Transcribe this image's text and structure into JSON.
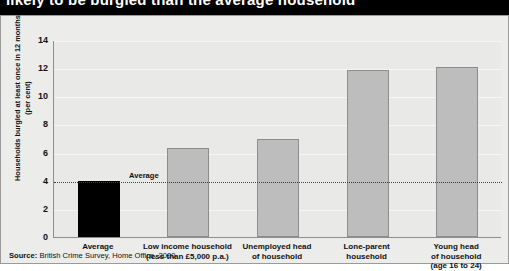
{
  "title": "likely to be burgled than the average household",
  "source_prefix": "Source:",
  "source_text": " British Crime Survey, Home Office, 2000",
  "average_annotation": "Average",
  "chart_data": {
    "type": "bar",
    "title": "likely to be burgled than the average household",
    "xlabel": "",
    "ylabel": "Households burgled at least once in 12 months (per cent)",
    "ylim": [
      0,
      14
    ],
    "yticks": [
      0,
      2,
      4,
      6,
      8,
      10,
      12,
      14
    ],
    "ytick_labels": [
      "0",
      "2",
      "4",
      "6",
      "8",
      "10",
      "12",
      "14"
    ],
    "grid": true,
    "legend": "none",
    "categories": [
      "Average",
      "Low income household (less than £5,000 p.a.)",
      "Unemployed head of household",
      "Lone-parent household",
      "Young head of household (age 16 to 24)"
    ],
    "category_lines": [
      [
        "Average"
      ],
      [
        "Low income household",
        "(less than £5,000 p.a.)"
      ],
      [
        "Unemployed head",
        "of household"
      ],
      [
        "Lone-parent",
        "household"
      ],
      [
        "Young head",
        "of household",
        "(age 16 to 24)"
      ]
    ],
    "values": [
      4.0,
      6.3,
      7.0,
      11.9,
      12.1
    ],
    "bar_colors": [
      "#000000",
      "#bdbdbd",
      "#bdbdbd",
      "#bdbdbd",
      "#bdbdbd"
    ],
    "reference_line": {
      "label": "Average",
      "value": 4.0,
      "style": "dotted"
    },
    "annotations": [
      {
        "text": "Source: British Crime Survey, Home Office, 2000"
      }
    ]
  }
}
